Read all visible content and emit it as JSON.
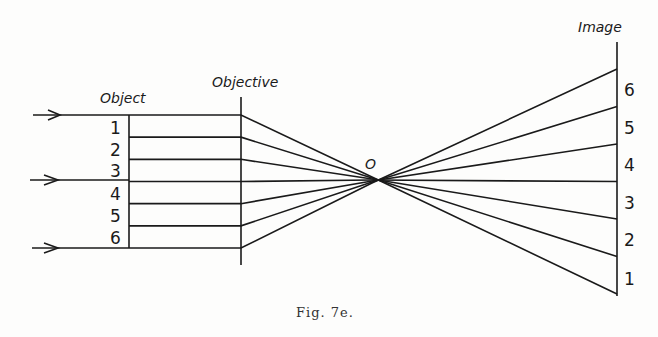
{
  "figure": {
    "labels": {
      "object": "Object",
      "objective": "Objective",
      "focal_point": "O",
      "image": "Image"
    },
    "object_numbers": [
      "1",
      "2",
      "3",
      "4",
      "5",
      "6"
    ],
    "image_numbers": [
      "6",
      "5",
      "4",
      "3",
      "2",
      "1"
    ],
    "caption": "Fig. 7e.",
    "arrows": [
      "top",
      "middle",
      "bottom"
    ],
    "ray_count": 7
  }
}
